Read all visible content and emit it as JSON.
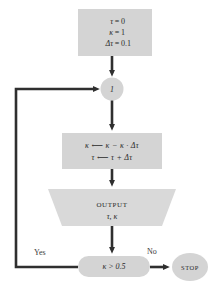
{
  "diagram": {
    "palette": {
      "node_fill": "#d4d4d4",
      "node_fill_light": "#d9d9d9",
      "arrow": "#2f2f2f",
      "text": "#3a3a3a",
      "background": "#ffffff"
    },
    "nodes": {
      "init": {
        "kind": "process-box",
        "lines": [
          {
            "lhs": "τ",
            "op": "=",
            "rhs": "0"
          },
          {
            "lhs": "κ",
            "op": "=",
            "rhs": "1"
          },
          {
            "lhs": "Δτ",
            "op": "=",
            "rhs": "0.1"
          }
        ]
      },
      "connector": {
        "kind": "circle-connector",
        "label": "1"
      },
      "process": {
        "kind": "process-box",
        "lines": [
          "κ  ⟵  κ  −  κ · Δτ",
          "τ  ⟵  τ  +  Δτ"
        ]
      },
      "output": {
        "kind": "output-trapezoid",
        "title": "OUTPUT",
        "variables": "τ, κ"
      },
      "decision": {
        "kind": "decision-stadium",
        "label": "κ > 0.5"
      },
      "stop": {
        "kind": "terminal-ellipse",
        "label": "STOP"
      }
    },
    "edges": {
      "yes_label": "Yes",
      "no_label": "No"
    }
  }
}
